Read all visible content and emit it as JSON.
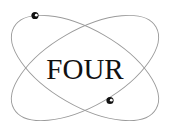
{
  "logo": {
    "text": "FOUR",
    "icon": "atom-orbits-icon",
    "colors": {
      "background": "#ffffff",
      "orbit_stroke": "#9a9a9a",
      "text": "#111111",
      "electron": "#111111"
    }
  }
}
